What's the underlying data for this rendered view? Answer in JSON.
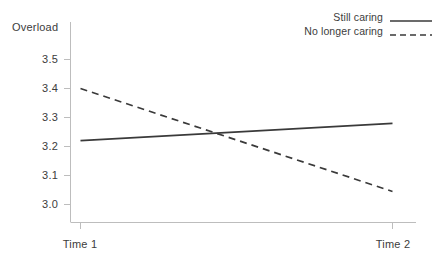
{
  "chart_data": {
    "type": "line",
    "title": "",
    "ylabel": "Overload",
    "xlabel": "",
    "categories": [
      "Time 1",
      "Time 2"
    ],
    "x_tick_labels": [
      "Time 1",
      "Time 2"
    ],
    "y_tick_labels": [
      "3.0",
      "3.1",
      "3.2",
      "3.3",
      "3.4",
      "3.5"
    ],
    "y_tick_values": [
      3.0,
      3.1,
      3.2,
      3.3,
      3.4,
      3.5
    ],
    "ylim": [
      2.95,
      3.55
    ],
    "grid": false,
    "legend_position": "top-right",
    "series": [
      {
        "name": "Still caring",
        "style": "solid",
        "color": "#3a3a3a",
        "values": [
          3.22,
          3.28
        ]
      },
      {
        "name": "No longer caring",
        "style": "dashed",
        "color": "#3a3a3a",
        "values": [
          3.4,
          3.045
        ]
      }
    ]
  },
  "legend": {
    "items": [
      {
        "label": "Still caring",
        "style": "solid"
      },
      {
        "label": "No longer caring",
        "style": "dashed"
      }
    ]
  },
  "colors": {
    "axis": "#b9b9b9",
    "line": "#3a3a3a",
    "text": "#3c3c3c",
    "background": "#ffffff"
  }
}
